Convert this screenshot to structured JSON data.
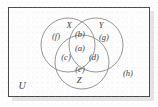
{
  "diagram": {
    "type": "venn-3-circle",
    "universe_label": "U",
    "set_labels": [
      {
        "id": "X",
        "text": "X",
        "x": 69,
        "y": 25
      },
      {
        "id": "Y",
        "text": "Y",
        "x": 101,
        "y": 25
      },
      {
        "id": "Z",
        "text": "Z",
        "x": 79,
        "y": 80
      }
    ],
    "region_labels": [
      {
        "id": "f",
        "text": "(f)",
        "region": "X only",
        "x": 56,
        "y": 36
      },
      {
        "id": "b",
        "text": "(b)",
        "region": "X and Y only",
        "x": 80,
        "y": 34
      },
      {
        "id": "g",
        "text": "(g)",
        "region": "Y only",
        "x": 104,
        "y": 37
      },
      {
        "id": "a",
        "text": "(a)",
        "region": "X and Y and Z",
        "x": 80,
        "y": 48
      },
      {
        "id": "c",
        "text": "(c)",
        "region": "X and Z only",
        "x": 66,
        "y": 57
      },
      {
        "id": "d",
        "text": "(d)",
        "region": "Y and Z only",
        "x": 94,
        "y": 57
      },
      {
        "id": "e",
        "text": "(e)",
        "region": "Z only",
        "x": 80,
        "y": 69
      },
      {
        "id": "h",
        "text": "(h)",
        "region": "outside all sets",
        "x": 128,
        "y": 73
      }
    ],
    "universe_position": {
      "x": 22,
      "y": 86
    },
    "circles": [
      {
        "id": "X",
        "cx": 68,
        "cy": 45,
        "r": 27
      },
      {
        "id": "Y",
        "cx": 96,
        "cy": 45,
        "r": 27
      },
      {
        "id": "Z",
        "cx": 82,
        "cy": 62,
        "r": 27
      }
    ],
    "frame": {
      "x": 8,
      "y": 7,
      "width": 142,
      "height": 90
    },
    "colors": {
      "page_background": "#fefefe",
      "frame_border": "#4a4a4a",
      "frame_fill": "#fdfdfd",
      "circle_stroke": "#8a8a8a",
      "text": "#3a3a3a",
      "shadow": "#cfcfcf"
    }
  }
}
